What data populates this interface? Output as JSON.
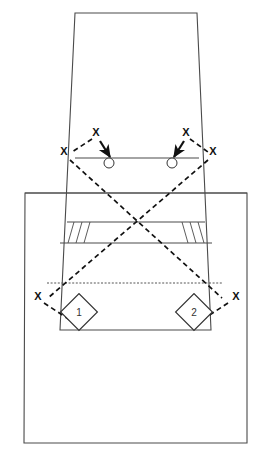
{
  "diagram": {
    "type": "sports-play-diagram",
    "colors": {
      "court_line": "#4a4a4a",
      "dashed_path": "#111111",
      "dotted_path": "#555555",
      "marker": "#111111",
      "background": "#ffffff"
    },
    "court": {
      "outer_frame": {
        "name": "outer-court-boundary",
        "points": "25,193 247,193 247,443 24,443"
      },
      "perspective_box": {
        "name": "inner-perspective-court",
        "points": "75,13 197,13 211,330 60,330"
      },
      "net_line": {
        "name": "net-line",
        "y": 158,
        "x1": 75,
        "x2": 199
      },
      "mid_horizontal_line": {
        "name": "mid-court-line",
        "y": 193,
        "x1": 25,
        "x2": 247
      },
      "band": {
        "name": "attack-zone-band",
        "top_y": 222,
        "bottom_y": 243,
        "left_top_x": 67,
        "left_bottom_x": 60,
        "right_top_x": 205,
        "right_bottom_x": 212
      },
      "band_dividers_left": [
        {
          "name": "band-divider-left-1",
          "x1": 74,
          "y1": 222,
          "x2": 68,
          "y2": 243
        },
        {
          "name": "band-divider-left-2",
          "x1": 82,
          "y1": 222,
          "x2": 76,
          "y2": 243
        },
        {
          "name": "band-divider-left-3",
          "x1": 90,
          "y1": 222,
          "x2": 84,
          "y2": 243
        }
      ],
      "band_dividers_right": [
        {
          "name": "band-divider-right-1",
          "x1": 198,
          "y1": 222,
          "x2": 204,
          "y2": 243
        },
        {
          "name": "band-divider-right-2",
          "x1": 190,
          "y1": 222,
          "x2": 196,
          "y2": 243
        },
        {
          "name": "band-divider-right-3",
          "x1": 182,
          "y1": 222,
          "x2": 188,
          "y2": 243
        }
      ],
      "baseline_dotted": {
        "name": "baseline-dotted-line",
        "y": 283,
        "x1": 47,
        "x2": 222
      }
    },
    "player_markers": [
      {
        "id": "x-top-left",
        "label": "X",
        "x": 96,
        "y": 136
      },
      {
        "id": "x-net-left",
        "label": "X",
        "x": 64,
        "y": 155
      },
      {
        "id": "x-top-right",
        "label": "X",
        "x": 186,
        "y": 136
      },
      {
        "id": "x-net-right",
        "label": "X",
        "x": 213,
        "y": 155
      },
      {
        "id": "x-base-left",
        "label": "X",
        "x": 38,
        "y": 300
      },
      {
        "id": "x-base-right",
        "label": "X",
        "x": 236,
        "y": 300
      }
    ],
    "target_circles": [
      {
        "id": "target-left",
        "cx": 109,
        "cy": 163,
        "r": 5
      },
      {
        "id": "target-right",
        "cx": 172,
        "cy": 163,
        "r": 5
      }
    ],
    "arrows": [
      {
        "id": "arrow-left",
        "x1": 100,
        "y1": 141,
        "x2": 110,
        "y2": 157
      },
      {
        "id": "arrow-right",
        "x1": 184,
        "y1": 141,
        "x2": 174,
        "y2": 157
      }
    ],
    "dashed_paths": [
      {
        "id": "dash-left-x-to-net",
        "d": "M 92 139 L 72 152"
      },
      {
        "id": "dash-right-x-to-net",
        "d": "M 190 139 L 208 152"
      },
      {
        "id": "dash-diag-left",
        "d": "M 70 160 L 222 298"
      },
      {
        "id": "dash-diag-right",
        "d": "M 208 160 L 48 298"
      },
      {
        "id": "dash-base-left-tail",
        "d": "M 44 303 L 76 324"
      },
      {
        "id": "dash-base-right-tail",
        "d": "M 228 303 L 196 324"
      }
    ],
    "numbered_markers": [
      {
        "id": "marker-1",
        "label": "1",
        "cx": 79,
        "cy": 312,
        "size": 18
      },
      {
        "id": "marker-2",
        "label": "2",
        "cx": 194,
        "cy": 312,
        "size": 18
      }
    ]
  }
}
